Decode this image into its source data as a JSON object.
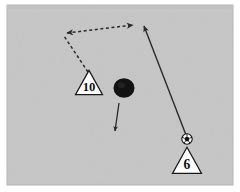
{
  "scene": {
    "title": "Soccer Passing Drill Diagram",
    "type": "sports-tactics-diagram",
    "canvas": {
      "width": 240,
      "height": 192
    },
    "field": {
      "label": "Playing field",
      "x": 7,
      "y": 5,
      "width": 226,
      "height": 180,
      "fill_color": "#c6c6c6",
      "border_color": "#b3b3b3"
    },
    "margin_color": "#ffffff"
  },
  "players": [
    {
      "id": "player-10",
      "label": "10",
      "shape": "triangle",
      "fill_color": "#ffffff",
      "stroke_color": "#1a1a1a",
      "text_color": "#111111",
      "x": 89,
      "y": 85,
      "size": 27
    },
    {
      "id": "player-6",
      "label": "6",
      "shape": "triangle",
      "fill_color": "#ffffff",
      "stroke_color": "#1a1a1a",
      "text_color": "#111111",
      "x": 187,
      "y": 163,
      "size": 29
    }
  ],
  "ball": {
    "label": "soccer-ball",
    "x": 187,
    "y": 139,
    "radius": 5.2,
    "fill_color": "#ffffff",
    "stroke_color": "#111111",
    "panel_color": "#111111"
  },
  "cone": {
    "label": "cone",
    "x": 124,
    "y": 88,
    "radius": 10.5,
    "fill_color": "#121212"
  },
  "movements": [
    {
      "id": "pass-line",
      "label": "Pass from player 6",
      "style": "solid",
      "color": "#2a2a2a",
      "width": 1.4,
      "points": [
        [
          186,
          135
        ],
        [
          144,
          26
        ]
      ],
      "arrowhead": "end"
    },
    {
      "id": "run-line-out",
      "label": "Run of player 10 upfield",
      "style": "dashed",
      "color": "#2a2a2a",
      "width": 1.5,
      "dash": "3,2.6",
      "points": [
        [
          88,
          72
        ],
        [
          64,
          36
        ]
      ],
      "arrowhead": "none"
    },
    {
      "id": "run-line-across",
      "label": "Run of player 10 across",
      "style": "dashed",
      "color": "#2a2a2a",
      "width": 1.5,
      "dash": "3,2.6",
      "points": [
        [
          67,
          33
        ],
        [
          133,
          25
        ]
      ],
      "arrowhead": "both"
    },
    {
      "id": "cone-direction",
      "label": "Direction marker below cone",
      "style": "solid",
      "color": "#2a2a2a",
      "width": 1.3,
      "points": [
        [
          119,
          103
        ],
        [
          115,
          131
        ]
      ],
      "arrowhead": "end"
    }
  ]
}
